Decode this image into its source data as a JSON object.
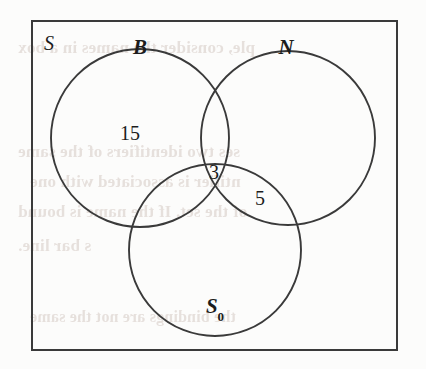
{
  "figure": {
    "kind": "venn-diagram",
    "background_color": "#fcfcfb",
    "stroke_color": "#3a3a3a",
    "text_color": "#1c1c1c",
    "bleed_color": "#8a6a5c"
  },
  "frame": {
    "name": "universal-set-rectangle",
    "x": 32,
    "y": 21,
    "width": 365,
    "height": 329,
    "stroke_width": 2
  },
  "universal_label": {
    "text": "S",
    "x": 44,
    "y": 33
  },
  "circles": [
    {
      "id": "B",
      "label": "B",
      "cx": 140,
      "cy": 138,
      "r": 89,
      "label_x": 140,
      "label_y": 47
    },
    {
      "id": "N",
      "label": "N",
      "cx": 288,
      "cy": 138,
      "r": 87,
      "label_x": 286,
      "label_y": 47
    },
    {
      "id": "S0",
      "label": "S",
      "label_sub": "0",
      "cx": 215,
      "cy": 250,
      "r": 86,
      "label_x": 215,
      "label_y": 308
    }
  ],
  "counts": [
    {
      "name": "count-B-only",
      "value": "15",
      "x": 130,
      "y": 133
    },
    {
      "name": "count-B-N-S0",
      "value": "3",
      "x": 214,
      "y": 172
    },
    {
      "name": "count-N-S0",
      "value": "5",
      "x": 260,
      "y": 198
    }
  ],
  "bleed_text": [
    {
      "text": "ple, consider the names in a box",
      "x": 18,
      "y": 38,
      "size": 17
    },
    {
      "text": "ses two identifiers of the same",
      "x": 18,
      "y": 142,
      "size": 17
    },
    {
      "text": "ntifier is associated with one",
      "x": 30,
      "y": 172,
      "size": 17
    },
    {
      "text": "of the set. If the name is bound",
      "x": 18,
      "y": 202,
      "size": 17
    },
    {
      "text": "s bar line.",
      "x": 18,
      "y": 236,
      "size": 17
    },
    {
      "text": "the bindings are not the same",
      "x": 30,
      "y": 308,
      "size": 16
    }
  ],
  "chart_data": {
    "type": "venn",
    "title": "",
    "sets": [
      "B",
      "N",
      "S0"
    ],
    "universal_set": "S",
    "regions": [
      {
        "sets": [
          "B"
        ],
        "label": "15",
        "value": 15
      },
      {
        "sets": [
          "B",
          "N",
          "S0"
        ],
        "label": "3",
        "value": 3
      },
      {
        "sets": [
          "N",
          "S0"
        ],
        "label": "5",
        "value": 5
      }
    ],
    "unlabeled_regions": [
      "N only",
      "S0 only",
      "B and N",
      "B and S0",
      "outside all"
    ]
  }
}
